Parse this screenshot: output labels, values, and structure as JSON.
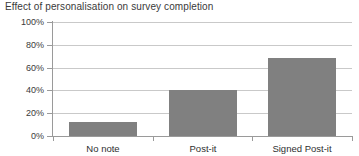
{
  "chart_data": {
    "type": "bar",
    "title": "Effect of personalisation on survey completion",
    "xlabel": "",
    "ylabel": "",
    "categories": [
      "No note",
      "Post-it",
      "Signed Post-it"
    ],
    "values": [
      12,
      40,
      68
    ],
    "value_unit": "%",
    "ylim": [
      0,
      100
    ],
    "ytick_labels": [
      "0%",
      "20%",
      "40%",
      "60%",
      "80%",
      "100%"
    ],
    "ytick_values": [
      0,
      20,
      40,
      60,
      80,
      100
    ],
    "grid": true,
    "legend": false,
    "series": [
      {
        "name": "Survey completion rate",
        "values": [
          12,
          40,
          68
        ],
        "color": "#808080"
      }
    ],
    "colors": {
      "bar_fill": "#808080",
      "gridline": "#c9c9c9",
      "axis_line": "#9a9a9a",
      "title_text": "#3a3a3a",
      "tick_text": "#3a3a3a",
      "category_text": "#2f2f2f",
      "background": "#ffffff"
    }
  }
}
